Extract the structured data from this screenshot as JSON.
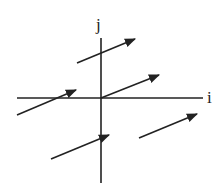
{
  "diagram": {
    "type": "vector-field",
    "colors": {
      "stroke": "#222222",
      "background": "#ffffff"
    },
    "axes": {
      "horizontal": {
        "label": "i",
        "x1": 17,
        "y1": 98,
        "x2": 203,
        "y2": 98
      },
      "vertical": {
        "label": "j",
        "x1": 101,
        "y1": 38,
        "x2": 101,
        "y2": 183
      }
    },
    "arrows": [
      {
        "x1": 77,
        "y1": 63,
        "x2": 135,
        "y2": 39
      },
      {
        "x1": 101,
        "y1": 98,
        "x2": 159,
        "y2": 75
      },
      {
        "x1": 17,
        "y1": 115,
        "x2": 76,
        "y2": 90
      },
      {
        "x1": 139,
        "y1": 138,
        "x2": 197,
        "y2": 114
      },
      {
        "x1": 51,
        "y1": 159,
        "x2": 109,
        "y2": 135
      }
    ]
  }
}
